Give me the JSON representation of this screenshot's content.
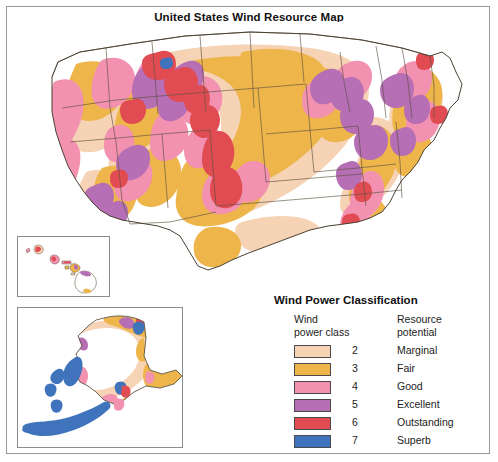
{
  "title": "United States Wind Resource Map",
  "legend": {
    "title": "Wind Power Classification",
    "header_class_line1": "Wind",
    "header_class_line2": "power class",
    "header_potential_line1": "Resource",
    "header_potential_line2": "potential",
    "rows": [
      {
        "class": "2",
        "potential": "Marginal",
        "color": "#f6d3b4"
      },
      {
        "class": "3",
        "potential": "Fair",
        "color": "#eeb54b"
      },
      {
        "class": "4",
        "potential": "Good",
        "color": "#f291b0"
      },
      {
        "class": "5",
        "potential": "Excellent",
        "color": "#b66eb4"
      },
      {
        "class": "6",
        "potential": "Outstanding",
        "color": "#e14b52"
      },
      {
        "class": "7",
        "potential": "Superb",
        "color": "#3f74bd"
      }
    ]
  },
  "map": {
    "main_region_name": "contiguous-united-states",
    "insets": [
      {
        "name": "hawaii"
      },
      {
        "name": "alaska"
      }
    ]
  },
  "colors": {
    "frame": "#9a9a9a",
    "state_border": "#5d5240",
    "coast_outline": "#4a4033",
    "background": "#ffffff"
  }
}
